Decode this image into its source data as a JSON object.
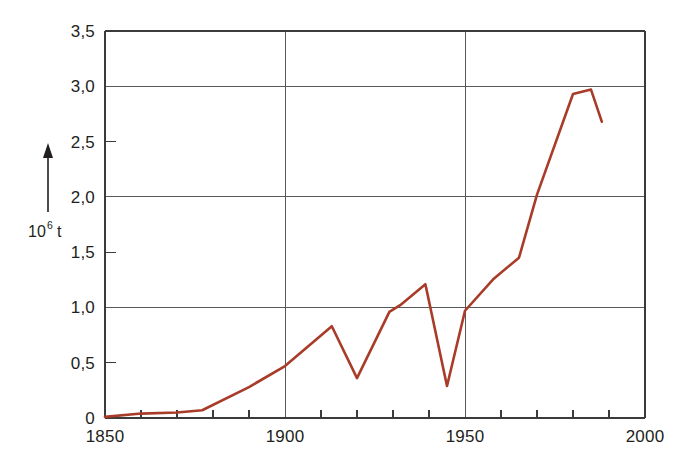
{
  "chart_data": {
    "type": "line",
    "title": "",
    "subtitle": "",
    "xlabel": "",
    "ylabel": "10^6 t",
    "ylabel_mantissa": "10",
    "ylabel_exponent": "6",
    "ylabel_unit": "t",
    "xlim": [
      1850,
      2000
    ],
    "ylim": [
      0,
      3.5
    ],
    "grid": true,
    "grid_x_values": [
      1850,
      1900,
      1950,
      2000
    ],
    "grid_y_values": [
      0,
      1.0,
      2.0,
      3.0,
      3.5
    ],
    "minor_tick_y_values": [
      0.5,
      1.5,
      2.5
    ],
    "x_minor_tick_interval": 10,
    "legend": "none",
    "x_tick_labels": [
      "1850",
      "1900",
      "1950",
      "2000"
    ],
    "x_tick_values": [
      1850,
      1900,
      1950,
      2000
    ],
    "y_tick_labels": [
      "0",
      "0,5",
      "1,0",
      "1,5",
      "2,0",
      "2,5",
      "3,0",
      "3,5"
    ],
    "y_tick_values": [
      0,
      0.5,
      1.0,
      1.5,
      2.0,
      2.5,
      3.0,
      3.5
    ],
    "decimal_separator": ",",
    "line_color": "#a83c29",
    "grid_color": "#58595b",
    "axis_color": "#3b3b3d",
    "background_color": "#ffffff",
    "series": [
      {
        "name": "production",
        "color": "#a83c29",
        "x": [
          1850,
          1860,
          1870,
          1877,
          1890,
          1900,
          1913,
          1920,
          1929,
          1932,
          1939,
          1945,
          1950,
          1958,
          1965,
          1970,
          1980,
          1985,
          1988
        ],
        "values": [
          0.01,
          0.04,
          0.05,
          0.07,
          0.28,
          0.47,
          0.83,
          0.36,
          0.96,
          1.02,
          1.21,
          0.29,
          0.97,
          1.26,
          1.45,
          2.02,
          2.93,
          2.97,
          2.68
        ]
      }
    ]
  }
}
